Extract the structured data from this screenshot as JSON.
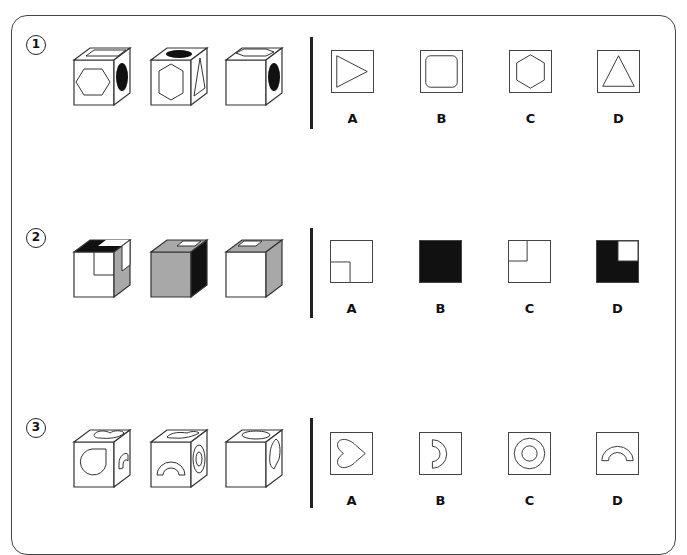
{
  "questions": [
    {
      "number": "1",
      "cubes": [
        {
          "front": "hexagon",
          "top": "square-outline",
          "right": "black-ellipse"
        },
        {
          "front": "hexagon",
          "top": "black-ellipse",
          "right": "triangle"
        },
        {
          "front": "blank",
          "top": "hexagon-outline",
          "right": "black-ellipse"
        }
      ],
      "options": [
        {
          "label": "A",
          "shape": "triangle-right"
        },
        {
          "label": "B",
          "shape": "rounded-square"
        },
        {
          "label": "C",
          "shape": "hexagon"
        },
        {
          "label": "D",
          "shape": "triangle-up"
        }
      ]
    },
    {
      "number": "2",
      "cubes": [
        {
          "front": "white-with-inner-corner",
          "top": "black-with-white-notch",
          "right": "gray-with-white-corner"
        },
        {
          "front": "gray",
          "top": "gray-with-white-notch",
          "right": "black"
        },
        {
          "front": "white",
          "top": "gray-with-white-notch",
          "right": "gray"
        }
      ],
      "options": [
        {
          "label": "A",
          "shape": "white-square-bottom-left-inner"
        },
        {
          "label": "B",
          "shape": "black-square"
        },
        {
          "label": "C",
          "shape": "white-square-top-left-inner"
        },
        {
          "label": "D",
          "shape": "black-square-white-top-right"
        }
      ]
    },
    {
      "number": "3",
      "cubes": [
        {
          "front": "drop-circle",
          "top": "heart",
          "right": "arch"
        },
        {
          "front": "arch",
          "top": "heart",
          "right": "ring"
        },
        {
          "front": "blank",
          "top": "ellipse",
          "right": "heart"
        }
      ],
      "options": [
        {
          "label": "A",
          "shape": "heart-sideways"
        },
        {
          "label": "B",
          "shape": "half-arch"
        },
        {
          "label": "C",
          "shape": "ring"
        },
        {
          "label": "D",
          "shape": "arch"
        }
      ]
    }
  ],
  "colors": {
    "stroke": "#333333",
    "black": "#111111",
    "gray": "#a8a8a8"
  }
}
